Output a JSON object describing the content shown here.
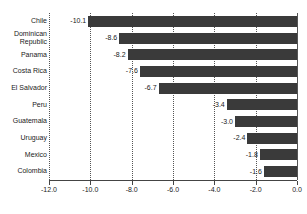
{
  "chart_data": {
    "type": "bar",
    "orientation": "horizontal",
    "title": "",
    "subtitle": "",
    "xlabel": "",
    "ylabel": "",
    "categories": [
      "Chile",
      "Dominican\nRepublic",
      "Panama",
      "Costa Rica",
      "El Salvador",
      "Peru",
      "Guatemala",
      "Uruguay",
      "Mexico",
      "Colombia"
    ],
    "values": [
      -10.1,
      -8.6,
      -8.2,
      -7.6,
      -6.7,
      -3.4,
      -3.0,
      -2.4,
      -1.8,
      -1.6
    ],
    "value_labels": [
      "-10.1",
      "-8.6",
      "-8.2",
      "-7.6",
      "-6.7",
      "-3.4",
      "-3.0",
      "-2.4",
      "-1.8",
      "-1.6"
    ],
    "xlim": [
      -12.0,
      0.0
    ],
    "xticks": [
      -12.0,
      -10.0,
      -8.0,
      -6.0,
      -4.0,
      -2.0,
      0.0
    ],
    "xtick_labels": [
      "-12.0",
      "-10.0",
      "-8.0",
      "-6.0",
      "-4.0",
      "-2.0",
      "0.0"
    ],
    "grid": true,
    "grid_style": "dotted-vertical",
    "legend": null,
    "bar_color": "#3a3a3a",
    "grid_color": "#555555",
    "axis_color": "#444444",
    "text_color": "#1a1a1a",
    "background": "#ffffff"
  }
}
